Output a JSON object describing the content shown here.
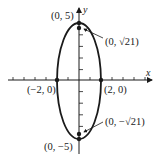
{
  "diagram": {
    "type": "ellipse-graph",
    "equation_implied": "x^2/4 + y^2/25 = 1",
    "axes": {
      "x_label": "x",
      "y_label": "y"
    },
    "points": {
      "top_vertex": "(0, 5)",
      "bottom_vertex": "(0, −5)",
      "left_covertex": "(−2, 0)",
      "right_covertex": "(2, 0)",
      "top_focus": "(0, √21)",
      "bottom_focus": "(0, −√21)"
    },
    "colors": {
      "stroke": "#1a1a1a",
      "background": "#ffffff"
    }
  }
}
